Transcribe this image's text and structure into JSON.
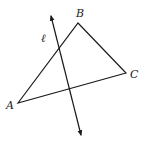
{
  "diagram": {
    "type": "geometry",
    "triangle": {
      "vertices": {
        "A": {
          "label": "A",
          "x": 18,
          "y": 103
        },
        "B": {
          "label": "B",
          "x": 78,
          "y": 23
        },
        "C": {
          "label": "C",
          "x": 126,
          "y": 73
        }
      }
    },
    "line": {
      "label": "ℓ",
      "start": {
        "x": 51,
        "y": 16
      },
      "end": {
        "x": 81,
        "y": 135
      },
      "arrows": "both"
    },
    "labels": {
      "A": "A",
      "B": "B",
      "C": "C",
      "l": "ℓ"
    },
    "colors": {
      "stroke": "#1a1a1a",
      "background": "#ffffff"
    }
  }
}
